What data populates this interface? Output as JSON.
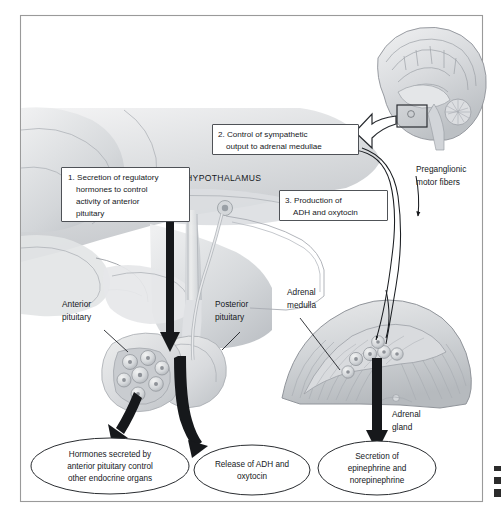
{
  "figure": {
    "domain_label": "anatomy-diagram",
    "region_label": "HYPOTHALAMUS"
  },
  "colors": {
    "frame": "#9a9a9a",
    "arrow_dark": "#16181b",
    "text": "#15181c",
    "box_stroke": "#3c4045",
    "tissue_light": "#e8e9ea",
    "tissue_mid": "#cfd2d5",
    "tissue_dark": "#b0b4b9"
  },
  "numbered_boxes": [
    {
      "id": "box-1",
      "number": "1.",
      "lines": [
        "1. Secretion of regulatory",
        "hormones to control",
        "activity of anterior",
        "pituitary"
      ]
    },
    {
      "id": "box-2",
      "number": "2.",
      "lines": [
        "2. Control of sympathetic",
        "output to adrenal medullae"
      ]
    },
    {
      "id": "box-3",
      "number": "3.",
      "lines": [
        "3. Production of",
        "ADH and oxytocin"
      ]
    }
  ],
  "leader_labels": [
    {
      "id": "label-anterior-pituitary",
      "lines": [
        "Anterior",
        "pituitary"
      ]
    },
    {
      "id": "label-posterior-pituitary",
      "lines": [
        "Posterior",
        "pituitary"
      ]
    },
    {
      "id": "label-adrenal-medulla",
      "lines": [
        "Adrenal",
        "medulla"
      ]
    },
    {
      "id": "label-adrenal-gland",
      "lines": [
        "Adrenal",
        "gland"
      ]
    },
    {
      "id": "label-preganglionic-fibers",
      "lines": [
        "Preganglionic",
        "motor fibers"
      ]
    }
  ],
  "outcome_ovals": [
    {
      "id": "oval-anterior-pituitary-output",
      "lines": [
        "Hormones secreted by",
        "anterior pituitary control",
        "other endocrine organs"
      ]
    },
    {
      "id": "oval-posterior-pituitary-output",
      "lines": [
        "Release of ADH and",
        "oxytocin"
      ]
    },
    {
      "id": "oval-adrenal-output",
      "lines": [
        "Secretion of",
        "epinephrine and",
        "norepinephrine"
      ]
    }
  ],
  "inset": {
    "id": "brain-sagittal-inset",
    "description": "midsagittal brain section with highlight box on hypothalamus and pointer arrow"
  }
}
